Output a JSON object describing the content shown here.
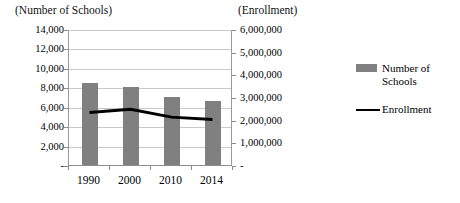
{
  "chart_data": {
    "type": "bar",
    "title": "",
    "categories": [
      "1990",
      "2000",
      "2010",
      "2014"
    ],
    "left_axis": {
      "label": "(Number of Schools)",
      "ticks": [
        "-",
        "2,000",
        "4,000",
        "6,000",
        "8,000",
        "10,000",
        "12,000",
        "14,000"
      ],
      "tick_values": [
        0,
        2000,
        4000,
        6000,
        8000,
        10000,
        12000,
        14000
      ],
      "ylim": [
        0,
        14000
      ]
    },
    "right_axis": {
      "label": "(Enrollment)",
      "ticks": [
        "-",
        "1,000,000",
        "2,000,000",
        "3,000,000",
        "4,000,000",
        "5,000,000",
        "6,000,000"
      ],
      "tick_values": [
        0,
        1000000,
        2000000,
        3000000,
        4000000,
        5000000,
        6000000
      ],
      "ylim": [
        0,
        6000000
      ]
    },
    "series": [
      {
        "name": "Number of Schools",
        "type": "bar",
        "axis": "left",
        "color": "#808080",
        "values": [
          8400,
          8000,
          7000,
          6600
        ]
      },
      {
        "name": "Enrollment",
        "type": "line",
        "axis": "right",
        "color": "#000000",
        "values": [
          2400000,
          2550000,
          2200000,
          2100000
        ]
      }
    ],
    "grid": true,
    "legend_position": "right"
  },
  "legend": {
    "items": [
      {
        "label": "Number of Schools",
        "marker": "bar-swatch",
        "color": "#808080"
      },
      {
        "label": "Enrollment",
        "marker": "line-swatch",
        "color": "#000000"
      }
    ]
  }
}
